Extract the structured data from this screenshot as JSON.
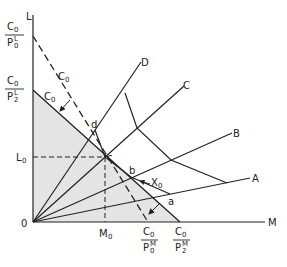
{
  "diagram": {
    "type": "isoquant-budget-diagram",
    "axes": {
      "x_label": "M",
      "y_label": "L",
      "origin_label": "0"
    },
    "colors": {
      "line": "#222222",
      "shaded_region": "#e4e4e4",
      "background": "#ffffff"
    },
    "budget_lines": [
      {
        "name": "original",
        "style": "dashed",
        "label": "C0",
        "y_intercept": {
          "num": "C0",
          "den": "P0L"
        },
        "x_intercept": {
          "num": "C0",
          "den": "P0M"
        }
      },
      {
        "name": "new",
        "style": "solid",
        "label": "C0",
        "y_intercept": {
          "num": "C0",
          "den": "P2L"
        },
        "x_intercept": {
          "num": "C0",
          "den": "P2M"
        }
      }
    ],
    "rays": [
      "A",
      "B",
      "C",
      "D"
    ],
    "isoquant": {
      "label": "X0",
      "points": [
        "d",
        "c",
        "b",
        "a"
      ]
    },
    "equilibrium": {
      "point": "c",
      "L_label": "L0",
      "M_label": "M0"
    }
  },
  "labels": {
    "L": "L",
    "M": "M",
    "O": "0",
    "C0": "C",
    "C0_sub": "0",
    "P": "P",
    "sub0": "0",
    "sub2": "2",
    "supL": "L",
    "supM": "M",
    "L0_main": "L",
    "L0_sub": "0",
    "M0_main": "M",
    "M0_sub": "0",
    "X0_main": "X",
    "X0_sub": "0",
    "A": "A",
    "B": "B",
    "C": "C",
    "D": "D",
    "a": "a",
    "b": "b",
    "c": "c",
    "d": "d"
  }
}
